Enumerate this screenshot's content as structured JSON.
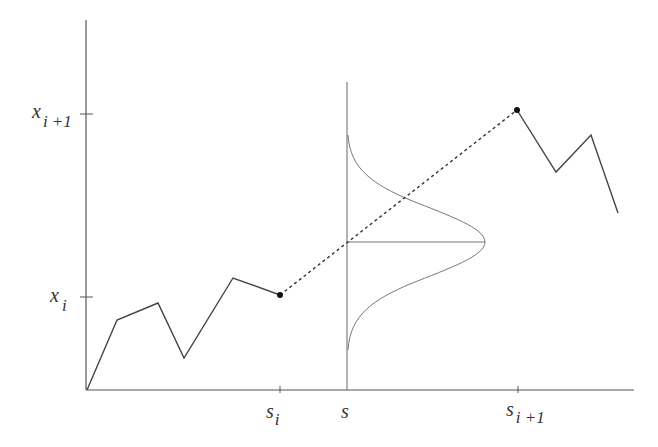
{
  "diagram": {
    "type": "brownian-bridge-interpolation",
    "y_axis_labels": {
      "upper": {
        "base": "x",
        "sub": "i +1"
      },
      "lower": {
        "base": "x",
        "sub": "i"
      }
    },
    "x_axis_labels": {
      "left": {
        "base": "s",
        "sub": "i"
      },
      "middle": {
        "base": "s",
        "sub": ""
      },
      "right": {
        "base": "s",
        "sub": "i +1"
      }
    },
    "colors": {
      "axis": "#555555",
      "path": "#444444",
      "gaussian": "#777777",
      "dot": "#111111"
    },
    "path_left": [
      [
        87,
        390
      ],
      [
        117,
        320
      ],
      [
        158,
        303
      ],
      [
        184,
        358
      ],
      [
        233,
        278
      ],
      [
        280,
        295
      ]
    ],
    "path_right": [
      [
        517,
        110
      ],
      [
        556,
        172
      ],
      [
        591,
        135
      ],
      [
        618,
        213
      ]
    ],
    "endpoint_left": [
      280,
      295
    ],
    "endpoint_right": [
      517,
      110
    ]
  }
}
